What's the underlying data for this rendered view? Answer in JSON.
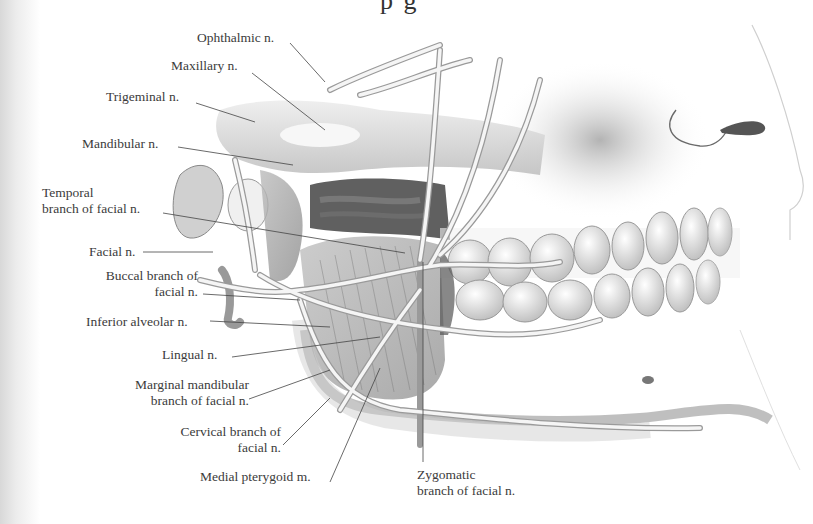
{
  "figure": {
    "heading_partial": "p                                      g"
  },
  "labels": {
    "ophthalmic": "Ophthalmic n.",
    "maxillary": "Maxillary n.",
    "trigeminal": "Trigeminal n.",
    "mandibular": "Mandibular n.",
    "temporal_1": "Temporal",
    "temporal_2": "branch of facial n.",
    "facial": "Facial n.",
    "buccal_1": "Buccal branch of",
    "buccal_2": "facial n.",
    "inferior_alveolar": "Inferior alveolar n.",
    "lingual": "Lingual n.",
    "marginal_1": "Marginal mandibular",
    "marginal_2": "branch of facial n.",
    "cervical_1": "Cervical branch of",
    "cervical_2": "facial n.",
    "medial_pterygoid": "Medial pterygoid m.",
    "zygomatic_1": "Zygomatic",
    "zygomatic_2": "branch of facial n."
  },
  "colors": {
    "background": "#ffffff",
    "text": "#3b3b3b",
    "leader_line": "#444444",
    "nerve": "#f4f4f4",
    "shade_dark": "#5a5a5a",
    "shade_mid": "#a8a8a8",
    "shade_light": "#d9d9d9"
  }
}
